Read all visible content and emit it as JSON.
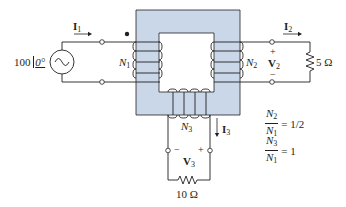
{
  "source": {
    "magnitude": "100",
    "angle": "0°",
    "label": "100 /0°"
  },
  "currents": {
    "i1": "I",
    "i1_sub": "1",
    "i2": "I",
    "i2_sub": "2",
    "i3": "I",
    "i3_sub": "3"
  },
  "windings": {
    "n1": "N",
    "n1_sub": "1",
    "n2": "N",
    "n2_sub": "2",
    "n3": "N",
    "n3_sub": "3"
  },
  "voltages": {
    "v2": "V",
    "v2_sub": "2",
    "v2_plus": "+",
    "v2_minus": "−",
    "v3": "V",
    "v3_sub": "3",
    "v3_plus": "+",
    "v3_minus": "−"
  },
  "loads": {
    "r2": "5 Ω",
    "r3": "10 Ω"
  },
  "ratios": [
    {
      "num": "N",
      "num_sub": "2",
      "den": "N",
      "den_sub": "1",
      "value": "= 1/2"
    },
    {
      "num": "N",
      "num_sub": "3",
      "den": "N",
      "den_sub": "1",
      "value": "= 1"
    }
  ],
  "colors": {
    "core_fill": "#c9d7e8",
    "core_stroke": "#231f20",
    "wire": "#231f20"
  }
}
